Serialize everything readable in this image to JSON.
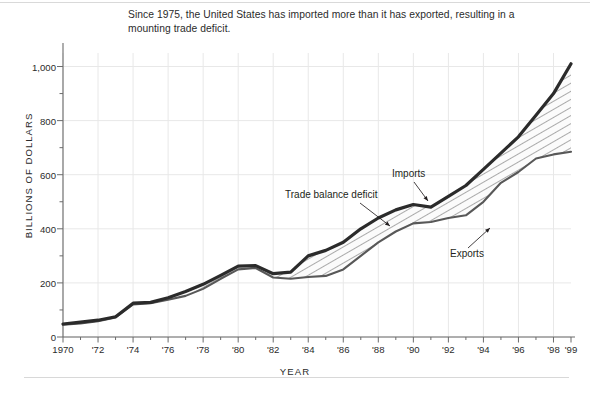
{
  "caption": "Since 1975, the United States has imported more than it has exported, resulting in a mounting trade deficit.",
  "annotations": {
    "imports": "Imports",
    "exports": "Exports",
    "deficit": "Trade balance deficit"
  },
  "colors": {
    "imports_line": "#2b2b2b",
    "exports_line": "#585858",
    "grid": "#e8e8e8",
    "axis": "#6b6b6b",
    "background": "#ffffff",
    "hatch": "#6e6e6e"
  },
  "chart_data": {
    "type": "area",
    "title": "",
    "xlabel": "YEAR",
    "ylabel": "BILLIONS OF DOLLARS",
    "xlim": [
      1970,
      1999
    ],
    "ylim": [
      0,
      1050
    ],
    "yticks": [
      0,
      200,
      400,
      600,
      800,
      1000
    ],
    "ytick_labels": [
      "0",
      "200",
      "400",
      "600",
      "800",
      "1,000"
    ],
    "yminor_step": 100,
    "xticks": [
      1970,
      1972,
      1974,
      1976,
      1978,
      1980,
      1982,
      1984,
      1986,
      1988,
      1990,
      1992,
      1994,
      1996,
      1998,
      1999
    ],
    "xtick_labels": [
      "1970",
      "'72",
      "'74",
      "'76",
      "'78",
      "'80",
      "'82",
      "'84",
      "'86",
      "'88",
      "'90",
      "'92",
      "'94",
      "'96",
      "'98",
      "'99"
    ],
    "grid": true,
    "legend": "none",
    "x": [
      1970,
      1971,
      1972,
      1973,
      1974,
      1975,
      1976,
      1977,
      1978,
      1979,
      1980,
      1981,
      1982,
      1983,
      1984,
      1985,
      1986,
      1987,
      1988,
      1989,
      1990,
      1991,
      1992,
      1993,
      1994,
      1995,
      1996,
      1997,
      1998,
      1999
    ],
    "series": [
      {
        "name": "Imports",
        "values": [
          48,
          55,
          62,
          75,
          125,
          128,
          145,
          168,
          195,
          228,
          262,
          264,
          234,
          240,
          300,
          320,
          350,
          400,
          440,
          470,
          490,
          480,
          520,
          560,
          620,
          680,
          740,
          820,
          900,
          1010
        ]
      },
      {
        "name": "Exports",
        "values": [
          45,
          50,
          58,
          72,
          120,
          125,
          138,
          152,
          178,
          215,
          250,
          255,
          220,
          215,
          222,
          226,
          250,
          300,
          350,
          390,
          420,
          425,
          440,
          450,
          500,
          570,
          610,
          660,
          675,
          685
        ]
      }
    ]
  }
}
